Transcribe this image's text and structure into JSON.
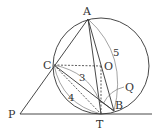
{
  "diagram": {
    "type": "geometry",
    "points": {
      "A": {
        "label": "A",
        "x": 88,
        "y": 19
      },
      "O": {
        "label": "O",
        "x": 101,
        "y": 66
      },
      "C": {
        "label": "C",
        "x": 54,
        "y": 65
      },
      "T": {
        "label": "T",
        "x": 101,
        "y": 114
      },
      "B": {
        "label": "B",
        "x": 114,
        "y": 111
      },
      "P": {
        "label": "P",
        "x": 20,
        "y": 114
      },
      "Q": {
        "label": "Q"
      }
    },
    "circle": {
      "center": "O",
      "radius": 48
    },
    "measures": {
      "AB": "5",
      "CQ": "3",
      "CT": "4"
    },
    "colors": {
      "stroke": "#333333",
      "background": "#ffffff"
    }
  }
}
